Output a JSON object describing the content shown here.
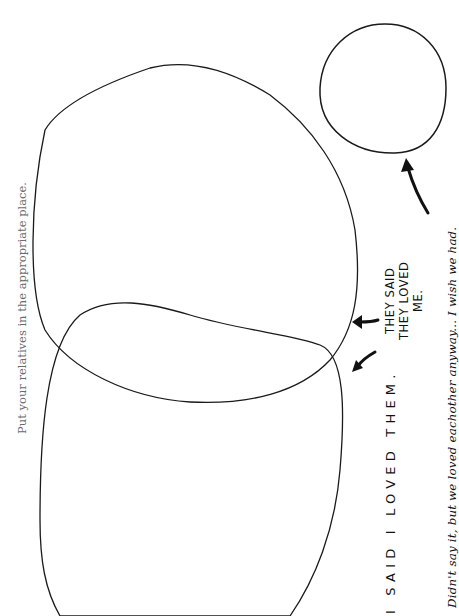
{
  "instruction": "Put your relatives in the appropriate place.",
  "labels": {
    "i_said": "I SAID I LOVED THEM.",
    "they_said_line1": "THEY SAID",
    "they_said_line2": "THEY LOVED",
    "they_said_line3": "ME.",
    "didnt_say": "Didn't say it, but we loved eachother anyway... I wish we had."
  },
  "diagram": {
    "type": "venn (rotated 90°)",
    "regions": [
      {
        "name": "upper-large-circle",
        "label": "They said they loved me."
      },
      {
        "name": "lower-large-circle",
        "label": "I said I loved them."
      },
      {
        "name": "small-circle",
        "label": "Didn't say it, but we loved eachother anyway... I wish we had."
      }
    ],
    "stroke_color": "#1a1a1a",
    "text_color": "#6b6b6b"
  }
}
